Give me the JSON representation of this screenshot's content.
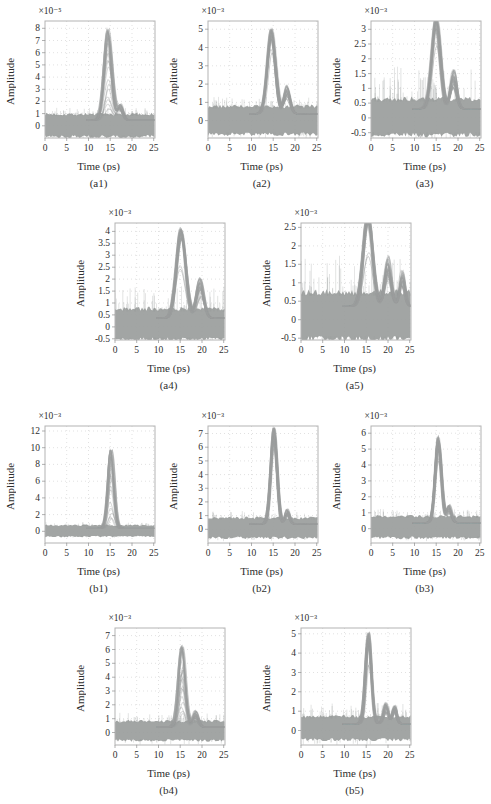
{
  "figure": {
    "background": "#ffffff",
    "trace_color": "#9b9e9d",
    "grid_color": "#d9d9d9",
    "axis_color": "#b3b3b3",
    "text_color": "#2e2e2e"
  },
  "chart_data": {
    "type": "line",
    "xlabel": "Time (ps)",
    "ylabel": "Amplitude",
    "xticks": [
      0,
      5,
      10,
      15,
      20,
      25
    ],
    "xlim": [
      0,
      25.3
    ],
    "grid": "dotted",
    "plots": [
      {
        "id": "a1",
        "caption": "(a1)",
        "scale_label": "×10⁻⁵",
        "yticks": [
          0,
          1,
          2,
          3,
          4,
          5,
          6,
          7,
          8
        ],
        "ylim": [
          -1.0,
          8.6
        ],
        "peak": {
          "t": 14.5,
          "amplitude": 7.5,
          "width": 1.25
        },
        "secondary_bumps": [
          {
            "t": 17.3,
            "amplitude": 1.15,
            "width": 0.9
          }
        ],
        "noise_band": {
          "low": -0.85,
          "high": 0.92
        },
        "render": {
          "spread": "full",
          "inner": [],
          "fuzz": 0.1
        }
      },
      {
        "id": "a2",
        "caption": "(a2)",
        "scale_label": "×10⁻³",
        "yticks": [
          0,
          1,
          2,
          3,
          4,
          5
        ],
        "ylim": [
          -0.95,
          5.45
        ],
        "peak": {
          "t": 14.6,
          "amplitude": 4.7,
          "width": 1.3
        },
        "secondary_bumps": [
          {
            "t": 18.2,
            "amplitude": 1.3,
            "width": 1.0
          }
        ],
        "noise_band": {
          "low": -0.72,
          "high": 0.75
        },
        "render": {
          "spread": "edge",
          "inner": [
            0.73
          ],
          "fuzz": 0.12
        }
      },
      {
        "id": "a3",
        "caption": "(a3)",
        "scale_label": "×10⁻³",
        "yticks": [
          -0.5,
          0,
          0.5,
          1,
          1.5,
          2,
          2.5,
          3
        ],
        "ylim": [
          -0.68,
          3.28
        ],
        "peak": {
          "t": 15.0,
          "amplitude": 3.12,
          "width": 1.35
        },
        "secondary_bumps": [
          {
            "t": 19.0,
            "amplitude": 1.12,
            "width": 1.0
          }
        ],
        "noise_band": {
          "low": -0.55,
          "high": 0.62
        },
        "render": {
          "spread": "edge",
          "inner": [
            0.7
          ],
          "fuzz": 0.3
        }
      },
      {
        "id": "a4",
        "caption": "(a4)",
        "scale_label": "×10⁻³",
        "yticks": [
          -0.5,
          0,
          0.5,
          1,
          1.5,
          2,
          2.5,
          3,
          3.5,
          4
        ],
        "ylim": [
          -0.55,
          4.35
        ],
        "peak": {
          "t": 15.2,
          "amplitude": 3.8,
          "width": 1.5
        },
        "secondary_bumps": [
          {
            "t": 19.6,
            "amplitude": 1.42,
            "width": 1.2
          }
        ],
        "noise_band": {
          "low": -0.5,
          "high": 0.73
        },
        "render": {
          "spread": "edge",
          "inner": [
            0.56
          ],
          "fuzz": 0.25
        }
      },
      {
        "id": "a5",
        "caption": "(a5)",
        "scale_label": "×10⁻³",
        "yticks": [
          -0.5,
          0,
          0.5,
          1,
          1.5,
          2,
          2.5
        ],
        "ylim": [
          -0.55,
          2.62
        ],
        "peak": {
          "t": 15.4,
          "amplitude": 2.56,
          "width": 1.5
        },
        "secondary_bumps": [
          {
            "t": 20.0,
            "amplitude": 1.15,
            "width": 1.1
          },
          {
            "t": 23.3,
            "amplitude": 0.82,
            "width": 0.9
          }
        ],
        "noise_band": {
          "low": -0.5,
          "high": 0.72
        },
        "render": {
          "spread": "edge",
          "inner": [
            0.55
          ],
          "fuzz": 0.3
        }
      },
      {
        "id": "b1",
        "caption": "(b1)",
        "scale_label": "×10⁻³",
        "yticks": [
          0,
          2,
          4,
          6,
          8,
          10,
          12
        ],
        "ylim": [
          -1.4,
          12.6
        ],
        "peak": {
          "t": 15.2,
          "amplitude": 9.5,
          "width": 0.95
        },
        "secondary_bumps": [],
        "noise_band": {
          "low": -0.6,
          "high": 0.7
        },
        "render": {
          "spread": "full",
          "inner": [],
          "fuzz": 0.1
        }
      },
      {
        "id": "b2",
        "caption": "(b2)",
        "scale_label": "×10⁻³",
        "yticks": [
          0,
          1,
          2,
          3,
          4,
          5,
          6,
          7
        ],
        "ylim": [
          -1.0,
          7.55
        ],
        "peak": {
          "t": 15.2,
          "amplitude": 7.1,
          "width": 1.0
        },
        "secondary_bumps": [
          {
            "t": 18.3,
            "amplitude": 0.95,
            "width": 0.7
          }
        ],
        "noise_band": {
          "low": -0.6,
          "high": 0.8
        },
        "render": {
          "spread": "edge",
          "inner": [
            0.8
          ],
          "fuzz": 0.12
        }
      },
      {
        "id": "b3",
        "caption": "(b3)",
        "scale_label": "×10⁻³",
        "yticks": [
          0,
          1,
          2,
          3,
          4,
          5,
          6
        ],
        "ylim": [
          -0.9,
          6.45
        ],
        "peak": {
          "t": 15.5,
          "amplitude": 5.45,
          "width": 1.0
        },
        "secondary_bumps": [
          {
            "t": 18.0,
            "amplitude": 0.95,
            "width": 0.8
          }
        ],
        "noise_band": {
          "low": -0.55,
          "high": 0.75
        },
        "render": {
          "spread": "edge",
          "inner": [
            0.73
          ],
          "fuzz": 0.12
        }
      },
      {
        "id": "b4",
        "caption": "(b4)",
        "scale_label": "×10⁻³",
        "yticks": [
          0,
          1,
          2,
          3,
          4,
          5,
          6,
          7
        ],
        "ylim": [
          -0.9,
          7.55
        ],
        "peak": {
          "t": 15.4,
          "amplitude": 5.9,
          "width": 1.1
        },
        "secondary_bumps": [
          {
            "t": 18.5,
            "amplitude": 1.0,
            "width": 0.9
          }
        ],
        "noise_band": {
          "low": -0.55,
          "high": 0.8
        },
        "render": {
          "spread": "full",
          "inner": [],
          "fuzz": 0.15
        }
      },
      {
        "id": "b5",
        "caption": "(b5)",
        "scale_label": "×10⁻³",
        "yticks": [
          0,
          1,
          2,
          3,
          4,
          5
        ],
        "ylim": [
          -0.75,
          5.3
        ],
        "peak": {
          "t": 15.5,
          "amplitude": 4.8,
          "width": 0.95
        },
        "secondary_bumps": [
          {
            "t": 19.5,
            "amplitude": 0.95,
            "width": 0.8
          },
          {
            "t": 21.5,
            "amplitude": 0.8,
            "width": 0.7
          }
        ],
        "noise_band": {
          "low": -0.45,
          "high": 0.7
        },
        "render": {
          "spread": "edge",
          "inner": [
            0.65
          ],
          "fuzz": 0.2
        }
      }
    ]
  }
}
